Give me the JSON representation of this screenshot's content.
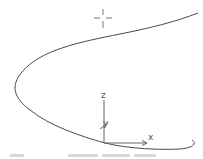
{
  "viewport": {
    "type": "3d-cad-viewport",
    "background_color": "#ffffff",
    "curve": {
      "name": "parabola-curve",
      "color": "#4a4a4a"
    },
    "cursor": {
      "name": "crosshair-cursor",
      "color": "#777777"
    },
    "ucs_icon": {
      "color": "#666666",
      "axes": [
        {
          "label": "Z",
          "text": "z"
        },
        {
          "label": "Y",
          "text": "y"
        },
        {
          "label": "X",
          "text": "x"
        }
      ]
    }
  },
  "status_strip": {
    "text": ""
  }
}
